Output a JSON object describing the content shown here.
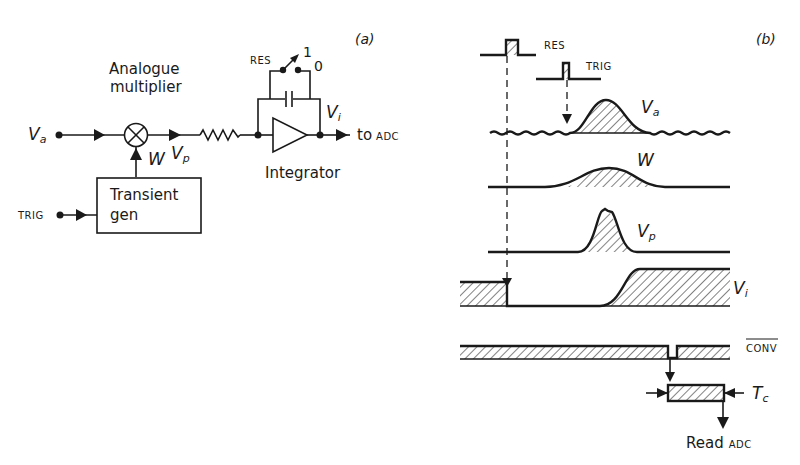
{
  "panel_a": {
    "label": "(a)",
    "input_va": {
      "symbol": "V",
      "sub": "a"
    },
    "multiplier_label_line1": "Analogue",
    "multiplier_label_line2": "multiplier",
    "w_label": "W",
    "vp_label": {
      "symbol": "V",
      "sub": "p"
    },
    "transient_line1": "Transient",
    "transient_line2": "gen",
    "trig_label": "TRIG",
    "res_label": "RES",
    "switch_pos1": "1",
    "switch_pos0": "0",
    "vi_label": {
      "symbol": "V",
      "sub": "i"
    },
    "output_label": "to",
    "output_label_small": "ADC",
    "integrator_label": "Integrator"
  },
  "panel_b": {
    "label": "(b)",
    "res_label": "RES",
    "trig_label": "TRIG",
    "va_label": {
      "symbol": "V",
      "sub": "a"
    },
    "w_label": "W",
    "vp_label": {
      "symbol": "V",
      "sub": "p"
    },
    "vi_label": {
      "symbol": "V",
      "sub": "i"
    },
    "conv_label": "CONV",
    "tc_label": {
      "symbol": "T",
      "sub": "c"
    },
    "read_label": "Read",
    "read_label_small": "ADC"
  },
  "colors": {
    "ink": "#1a1a1a",
    "background": "#ffffff"
  }
}
